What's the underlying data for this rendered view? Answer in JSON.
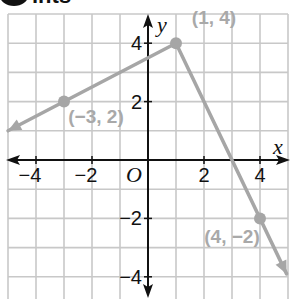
{
  "header": {
    "text": "ints"
  },
  "chart_data": {
    "type": "line",
    "title": "",
    "xlabel": "x",
    "ylabel": "y",
    "origin_label": "O",
    "xlim": [
      -5,
      5
    ],
    "ylim": [
      -4.5,
      5
    ],
    "grid": true,
    "x_ticks": [
      {
        "value": -4,
        "label": "−4"
      },
      {
        "value": -2,
        "label": "−2"
      },
      {
        "value": 2,
        "label": "2"
      },
      {
        "value": 4,
        "label": "4"
      }
    ],
    "y_ticks": [
      {
        "value": 4,
        "label": "4"
      },
      {
        "value": 2,
        "label": "2"
      },
      {
        "value": -2,
        "label": "−2"
      },
      {
        "value": -4,
        "label": "−4"
      }
    ],
    "series": [
      {
        "name": "piecewise",
        "color": "#a6a6a6",
        "points": [
          {
            "x": -5,
            "y": 1.0,
            "arrow": true
          },
          {
            "x": 1,
            "y": 4
          },
          {
            "x": 4.95,
            "y": -3.9,
            "arrow": true
          }
        ]
      }
    ],
    "marked_points": [
      {
        "x": -3,
        "y": 2,
        "label": "(−3, 2)"
      },
      {
        "x": 1,
        "y": 4,
        "label": "(1, 4)"
      },
      {
        "x": 4,
        "y": -2,
        "label": "(4, −2)"
      }
    ],
    "colors": {
      "axis": "#111111",
      "grid": "#c8c8c8",
      "line": "#a6a6a6",
      "annotation": "#a9a9a9"
    }
  }
}
